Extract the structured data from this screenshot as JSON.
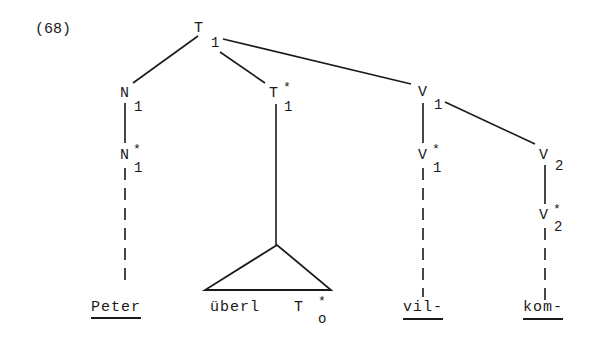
{
  "example_number": "(68)",
  "nodes": {
    "root": {
      "label": "T",
      "sub": "1"
    },
    "n1": {
      "label": "N",
      "sub": "1"
    },
    "t1star": {
      "label": "T",
      "sup": "*",
      "sub": "1"
    },
    "v1": {
      "label": "V",
      "sub": "1"
    },
    "n1star": {
      "label": "N",
      "sup": "*",
      "sub": "1"
    },
    "v1star": {
      "label": "V",
      "sup": "*",
      "sub": "1"
    },
    "v2": {
      "label": "V",
      "sub": "2"
    },
    "v2star": {
      "label": "V",
      "sup": "*",
      "sub": "2"
    }
  },
  "leaves": {
    "peter": {
      "text": "Peter",
      "underlined": true
    },
    "uberl": {
      "text": "überl",
      "underlined": false
    },
    "t0star": {
      "label": "T",
      "sup": "*",
      "sub": "o"
    },
    "vil": {
      "text": "vil-",
      "underlined": true
    },
    "kom": {
      "text": "kom-",
      "underlined": true
    }
  },
  "colors": {
    "ink": "#1a1a1a",
    "background": "#ffffff"
  }
}
